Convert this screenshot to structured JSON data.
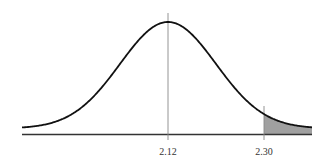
{
  "chart_data": {
    "type": "area",
    "title": "",
    "xlabel": "",
    "ylabel": "",
    "distribution": "normal",
    "mean": 2.12,
    "sd": 0.09,
    "shaded_region": {
      "from": 2.3,
      "to": "right tail",
      "color": "#999999"
    },
    "vertical_markers": [
      {
        "x": 2.12,
        "label": "2.12"
      },
      {
        "x": 2.3,
        "label": "2.30"
      }
    ],
    "tick_labels": [
      "2.12",
      "2.30"
    ],
    "grid": false,
    "legend": null
  },
  "labels": {
    "mean": "2.12",
    "cutoff": "2.30"
  },
  "colors": {
    "curve": "#111111",
    "axis": "#333333",
    "marker": "#888888",
    "shade": "#a0a0a0"
  }
}
